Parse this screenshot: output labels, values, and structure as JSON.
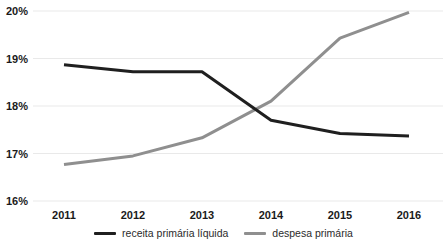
{
  "chart_data": {
    "type": "line",
    "categories": [
      "2011",
      "2012",
      "2013",
      "2014",
      "2015",
      "2016"
    ],
    "series": [
      {
        "name": "receita primária líquida",
        "color": "#1f1f1f",
        "values": [
          18.87,
          18.72,
          18.72,
          17.7,
          17.42,
          17.37
        ]
      },
      {
        "name": "despesa primária",
        "color": "#8f8f8f",
        "values": [
          16.77,
          16.95,
          17.33,
          18.1,
          19.43,
          19.97
        ]
      }
    ],
    "y_ticks": [
      {
        "value": 20,
        "label": "20%"
      },
      {
        "value": 19,
        "label": "19%"
      },
      {
        "value": 18,
        "label": "18%"
      },
      {
        "value": 17,
        "label": "17%"
      },
      {
        "value": 16,
        "label": "16%"
      }
    ],
    "ylim": [
      16,
      20
    ],
    "grid": "horizontal",
    "legend_position": "bottom",
    "colors": {
      "background": "#ffffff",
      "gridline": "#e9e9e9",
      "tick_label": "#1a1a1a",
      "legend_text": "#2b2b2b"
    }
  }
}
